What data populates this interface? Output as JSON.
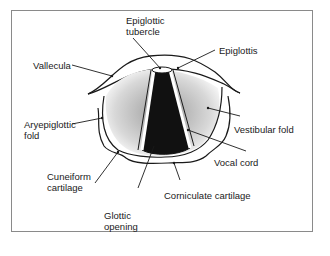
{
  "figure": {
    "labels": {
      "epiglottic_tubercle": "Epiglottic\ntubercle",
      "epiglottis": "Epiglottis",
      "vallecula": "Vallecula",
      "aryepiglottic_fold": "Aryepiglottic\nfold",
      "vestibular_fold": "Vestibular fold",
      "vocal_cord": "Vocal cord",
      "cuneiform_cartilage": "Cuneiform\ncartilage",
      "corniculate_cartilage": "Corniculate cartilage",
      "glottic_opening": "Glottic\nopening"
    },
    "colors": {
      "ink": "#1a1a1a",
      "frame": "#8a8a8a",
      "background": "#ffffff"
    }
  }
}
